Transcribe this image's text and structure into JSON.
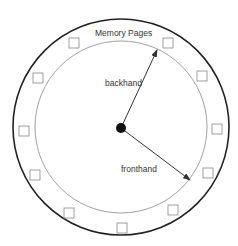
{
  "diagram": {
    "title": "Memory Pages",
    "hands": [
      {
        "name": "backhand",
        "label": "backhand"
      },
      {
        "name": "fronthand",
        "label": "fronthand"
      }
    ],
    "page_count": 12,
    "colors": {
      "outer_ring": "#222222",
      "inner_ring": "#888888",
      "page_box": "#888888",
      "hand": "#333333",
      "hub": "#111111",
      "text": "#333333"
    }
  }
}
